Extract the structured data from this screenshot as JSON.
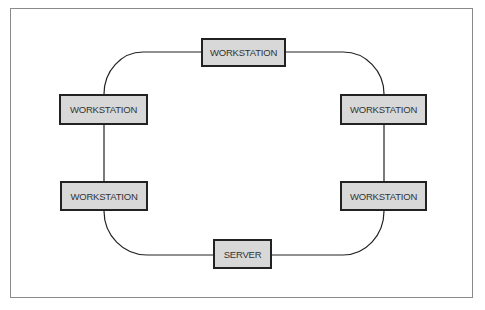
{
  "diagram": {
    "type": "ring-network-topology",
    "colors": {
      "node_fill": "#d8d8d8",
      "node_border": "#222222",
      "node_text": "#333333",
      "link": "#222222",
      "frame": "#8a8a8a"
    },
    "nodes": [
      {
        "id": "ws-top",
        "label": "WORKSTATION"
      },
      {
        "id": "ws-left-upper",
        "label": "WORKSTATION"
      },
      {
        "id": "ws-right-upper",
        "label": "WORKSTATION"
      },
      {
        "id": "ws-left-lower",
        "label": "WORKSTATION"
      },
      {
        "id": "ws-right-lower",
        "label": "WORKSTATION"
      },
      {
        "id": "server-bottom",
        "label": "SERVER"
      }
    ],
    "links": [
      [
        "ws-top",
        "ws-right-upper"
      ],
      [
        "ws-right-upper",
        "ws-right-lower"
      ],
      [
        "ws-right-lower",
        "server-bottom"
      ],
      [
        "server-bottom",
        "ws-left-lower"
      ],
      [
        "ws-left-lower",
        "ws-left-upper"
      ],
      [
        "ws-left-upper",
        "ws-top"
      ]
    ]
  }
}
